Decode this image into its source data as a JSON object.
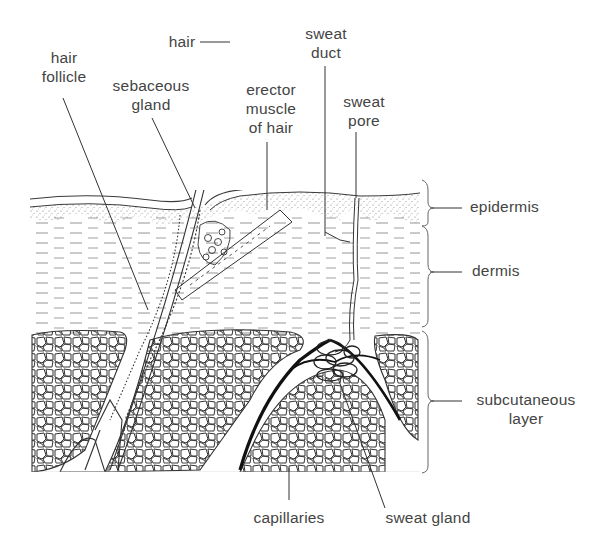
{
  "figure": {
    "type": "cross-section diagram",
    "labels": {
      "hair_follicle": [
        "hair",
        "follicle"
      ],
      "hair": [
        "hair"
      ],
      "sebaceous_gland": [
        "sebaceous",
        "gland"
      ],
      "erector_muscle": [
        "erector",
        "muscle",
        "of hair"
      ],
      "sweat_duct": [
        "sweat",
        "duct"
      ],
      "sweat_pore": [
        "sweat",
        "pore"
      ],
      "epidermis": [
        "epidermis"
      ],
      "dermis": [
        "dermis"
      ],
      "subcutaneous_layer": [
        "subcutaneous",
        "layer"
      ],
      "capillaries": [
        "capillaries"
      ],
      "sweat_gland": [
        "sweat gland"
      ]
    },
    "layers": [
      {
        "name": "epidermis",
        "bracket_top": 198,
        "bracket_bottom": 225
      },
      {
        "name": "dermis",
        "bracket_top": 226,
        "bracket_bottom": 326
      },
      {
        "name": "subcutaneous layer",
        "bracket_top": 332,
        "bracket_bottom": 472
      }
    ],
    "colors": {
      "line": "#3a3a3a",
      "text": "#444444",
      "capillary": "#111111",
      "background": "#ffffff"
    }
  }
}
